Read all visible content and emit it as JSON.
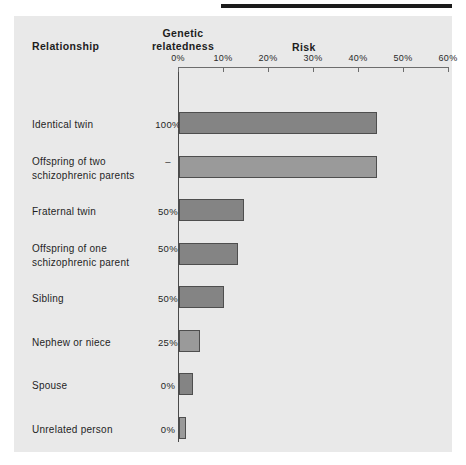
{
  "figure": {
    "panel_bg": "#e9e9e9",
    "bar_fill": "#848484",
    "bar_stroke": "#4e4e4e",
    "axis_color": "#6d6d6d"
  },
  "headers": {
    "relationship": "Relationship",
    "genetic_line1": "Genetic",
    "genetic_line2": "relatedness",
    "risk": "Risk"
  },
  "chart_data": {
    "type": "bar",
    "orientation": "horizontal",
    "title": "Risk",
    "xlabel": "Risk",
    "ylabel": "Relationship",
    "xlim": [
      0,
      60
    ],
    "grid": false,
    "legend": "none",
    "tick_labels": [
      "0%",
      "10%",
      "20%",
      "30%",
      "40%",
      "50%",
      "60%"
    ],
    "ticks": [
      0,
      10,
      20,
      30,
      40,
      50,
      60
    ],
    "categories": [
      "Identical twin",
      "Offspring of two schizophrenic parents",
      "Fraternal twin",
      "Offspring of one schizophrenic parent",
      "Sibling",
      "Nephew or niece",
      "Spouse",
      "Unrelated person"
    ],
    "values": [
      44,
      44,
      14.5,
      13,
      10,
      4.7,
      3,
      1.5
    ],
    "genetic_relatedness": [
      "100%",
      "–",
      "50%",
      "50%",
      "50%",
      "25%",
      "0%",
      "0%"
    ]
  },
  "rows": [
    {
      "label": "Identical twin",
      "genetic": "100%",
      "value": 44,
      "top": 96,
      "label_top": 102,
      "light": false
    },
    {
      "label": "Offspring  of two\nschizophrenic parents",
      "genetic": "–",
      "value": 44,
      "top": 140,
      "label_top": 139,
      "light": true
    },
    {
      "label": "Fraternal twin",
      "genetic": "50%",
      "value": 14.5,
      "top": 183,
      "label_top": 189,
      "light": false
    },
    {
      "label": "Offspring  of one\nschizophrenic parent",
      "genetic": "50%",
      "value": 13,
      "top": 227,
      "label_top": 226,
      "light": false
    },
    {
      "label": "Sibling",
      "genetic": "50%",
      "value": 10,
      "top": 270,
      "label_top": 276,
      "light": false
    },
    {
      "label": "Nephew or niece",
      "genetic": "25%",
      "value": 4.7,
      "top": 314,
      "label_top": 320,
      "light": true
    },
    {
      "label": "Spouse",
      "genetic": "0%",
      "value": 3,
      "top": 357,
      "label_top": 363,
      "light": false
    },
    {
      "label": "Unrelated person",
      "genetic": "0%",
      "value": 1.5,
      "top": 401,
      "label_top": 407,
      "light": true
    }
  ]
}
